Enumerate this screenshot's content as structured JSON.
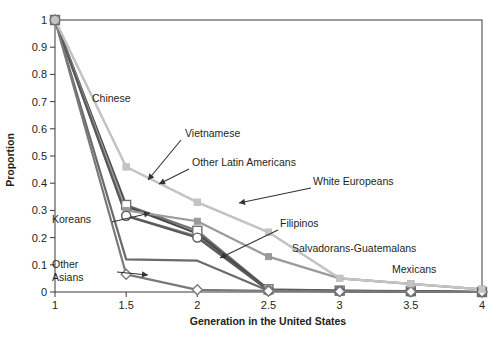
{
  "chart_data": {
    "type": "line",
    "title": "",
    "xlabel": "Generation in the United States",
    "ylabel": "Proportion",
    "x": [
      1,
      1.5,
      2,
      2.5,
      3,
      3.5,
      4
    ],
    "xlim": [
      1,
      4
    ],
    "ylim": [
      0,
      1
    ],
    "xticks": [
      "1",
      "1.5",
      "2",
      "2.5",
      "3",
      "3.5",
      "4"
    ],
    "yticks": [
      "0",
      "0.1",
      "0.2",
      "0.3",
      "0.4",
      "0.5",
      "0.6",
      "0.7",
      "0.8",
      "0.9",
      "1"
    ],
    "grid": false,
    "legend_position": "inline-annotations",
    "series": [
      {
        "name": "Chinese",
        "color": "#b9b9b9",
        "marker": "square-filled",
        "values": [
          1.0,
          0.46,
          0.33,
          0.22,
          0.05,
          0.03,
          0.01
        ]
      },
      {
        "name": "Vietnamese",
        "color": "#8a8a8a",
        "marker": "circle-open",
        "values": [
          1.0,
          0.28,
          0.205,
          0.005,
          0.003,
          0.002,
          0.0
        ]
      },
      {
        "name": "Other Latin Americans",
        "color": "#707070",
        "marker": "square-open",
        "values": [
          1.0,
          0.32,
          0.225,
          0.01,
          0.005,
          0.003,
          0.0
        ]
      },
      {
        "name": "White Europeans",
        "color": "#4a4a4a",
        "marker": "none",
        "values": [
          1.0,
          0.315,
          0.215,
          0.008,
          0.004,
          0.002,
          0.0
        ]
      },
      {
        "name": "Filipinos",
        "color": "#9a9a9a",
        "marker": "square-filled",
        "values": [
          1.0,
          0.3,
          0.26,
          0.13,
          0.05,
          0.03,
          0.01
        ]
      },
      {
        "name": "Salvadorans-Guatemalans",
        "color": "#6a6a6a",
        "marker": "none",
        "values": [
          1.0,
          0.12,
          0.115,
          0.005,
          0.003,
          0.002,
          0.0
        ]
      },
      {
        "name": "Koreans",
        "color": "#5a5a5a",
        "marker": "circle-open",
        "values": [
          1.0,
          0.28,
          0.2,
          0.006,
          0.003,
          0.002,
          0.0
        ]
      },
      {
        "name": "Other Asians",
        "color": "#7a7a7a",
        "marker": "diamond-open",
        "values": [
          1.0,
          0.065,
          0.008,
          0.004,
          0.002,
          0.001,
          0.0
        ]
      },
      {
        "name": "Mexicans",
        "color": "#c4c4c4",
        "marker": "square-filled",
        "values": [
          1.0,
          0.46,
          0.33,
          0.22,
          0.05,
          0.03,
          0.01
        ]
      }
    ],
    "annotations": [
      {
        "label": "Chinese",
        "x": 92,
        "y": 102,
        "anchor": "start",
        "arrow": false
      },
      {
        "label": "Vietnamese",
        "x": 185,
        "y": 137,
        "anchor": "start",
        "arrow": true
      },
      {
        "label": "Other Latin Americans",
        "x": 192,
        "y": 166,
        "anchor": "start",
        "arrow": true
      },
      {
        "label": "White Europeans",
        "x": 313,
        "y": 185,
        "anchor": "start",
        "arrow": true
      },
      {
        "label": "Koreans",
        "x": 52,
        "y": 223,
        "anchor": "start",
        "arrow": true
      },
      {
        "label": "Filipinos",
        "x": 280,
        "y": 227,
        "anchor": "start",
        "arrow": true
      },
      {
        "label": "Salvadorans-Guatemalans",
        "x": 292,
        "y": 252,
        "anchor": "start",
        "arrow": false
      },
      {
        "label": "Mexicans",
        "x": 392,
        "y": 273,
        "anchor": "start",
        "arrow": false
      },
      {
        "label": "Other Asians",
        "x": 52,
        "y": 268,
        "anchor": "start",
        "arrow": true
      }
    ]
  }
}
